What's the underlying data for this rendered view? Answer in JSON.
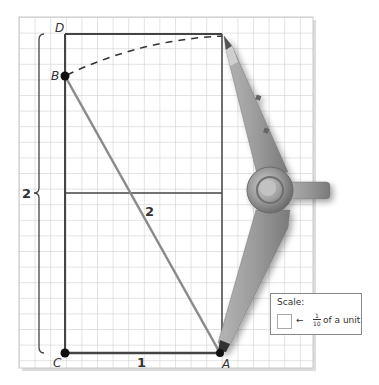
{
  "figure": {
    "type": "geometric construction with compass on grid paper",
    "points": {
      "A": {
        "label": "A"
      },
      "B": {
        "label": "B"
      },
      "C": {
        "label": "C"
      },
      "D": {
        "label": "D"
      }
    },
    "measurements": {
      "height_label": "2",
      "hypotenuse_label": "2",
      "base_label": "1"
    },
    "scale": {
      "title": "Scale:",
      "arrow": "←",
      "fraction_numerator": "1",
      "fraction_denominator": "10",
      "text": "of a unit"
    },
    "colors": {
      "grid_line": "#c8c8c8",
      "rectangle_line": "#444444",
      "hypotenuse_line": "#8a8a8a",
      "compass_body": "#9a9a9a",
      "point_fill": "#111111"
    }
  }
}
